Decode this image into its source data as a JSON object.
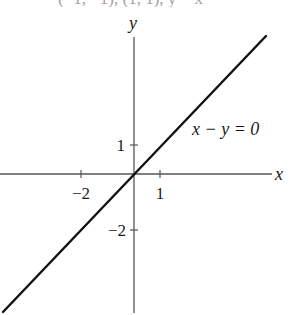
{
  "figure": {
    "top_cut_text": "(−1, −1), (1, 1), y = x",
    "axes": {
      "x_label": "x",
      "y_label": "y",
      "origin_px": [
        134,
        174
      ],
      "x_unit_px": 26.5,
      "y_unit_px": 28.5,
      "x_ticks": [
        {
          "value": -2,
          "label": "−2"
        },
        {
          "value": 1,
          "label": "1"
        }
      ],
      "y_ticks": [
        {
          "value": 1,
          "label": "1"
        },
        {
          "value": -2,
          "label": "−2"
        }
      ]
    },
    "line": {
      "equation_label": "x − y = 0",
      "color": "#111111",
      "start_px": [
        3,
        312
      ],
      "end_px": [
        266,
        36
      ]
    },
    "axis_color": "#555555"
  }
}
